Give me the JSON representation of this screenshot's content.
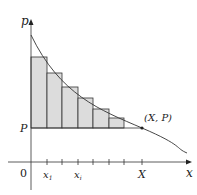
{
  "diagram": {
    "axes": {
      "y_label": "p",
      "x_label": "x",
      "origin_label": "0"
    },
    "labels": {
      "price_level": "P",
      "point": "(X, P)",
      "tick_x1": "x",
      "tick_x1_sub": "1",
      "tick_xi": "x",
      "tick_xi_sub": "i",
      "tick_X": "X"
    },
    "colors": {
      "rect_fill": "#dcdcdc",
      "line": "#333333"
    },
    "rectangles": [
      {
        "x": 31,
        "top": 57
      },
      {
        "x": 47,
        "top": 73
      },
      {
        "x": 62,
        "top": 87
      },
      {
        "x": 78,
        "top": 98
      },
      {
        "x": 93,
        "top": 109
      },
      {
        "x": 109,
        "top": 118
      }
    ]
  }
}
